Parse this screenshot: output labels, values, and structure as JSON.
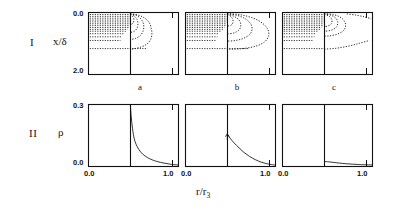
{
  "figure": {
    "width": 403,
    "height": 209,
    "background": "#ffffff",
    "ink": "#111111"
  },
  "rows": [
    {
      "id": "row-I",
      "numeral": "I",
      "ylabel": "x/δ",
      "ytop": "0.0",
      "ybottom": "2.0"
    },
    {
      "id": "row-II",
      "numeral": "II",
      "ylabel": "ρ",
      "ytop": "0.3",
      "ybottom": "0.0"
    }
  ],
  "columns": [
    {
      "letter": "a"
    },
    {
      "letter": "b"
    },
    {
      "letter": "c"
    }
  ],
  "xaxis": {
    "title_main": "r/r",
    "title_sub": "3",
    "left_tick": "0.0",
    "right_tick": "1.0"
  },
  "chart_data": [
    {
      "id": "I-a",
      "type": "line",
      "title": "a",
      "xlabel": "r/r3",
      "ylabel": "x/δ",
      "xlim": [
        0.0,
        1.0
      ],
      "ylim": [
        2.0,
        0.0
      ],
      "y_inverted": true,
      "grid": false,
      "legend": "none",
      "vertical_marker_x": 0.47,
      "series": [
        {
          "name": "recirculation-contour",
          "style": "dotted",
          "points": [
            [
              0.47,
              0.06
            ],
            [
              0.56,
              0.1
            ],
            [
              0.63,
              0.2
            ],
            [
              0.68,
              0.34
            ],
            [
              0.7,
              0.5
            ],
            [
              0.71,
              0.68
            ],
            [
              0.7,
              0.86
            ],
            [
              0.66,
              1.02
            ],
            [
              0.59,
              1.13
            ],
            [
              0.5,
              1.19
            ],
            [
              0.47,
              1.2
            ]
          ]
        },
        {
          "name": "inner-contour-1",
          "style": "dotted",
          "points": [
            [
              0.47,
              0.06
            ],
            [
              0.53,
              0.1
            ],
            [
              0.58,
              0.2
            ],
            [
              0.61,
              0.33
            ],
            [
              0.62,
              0.48
            ],
            [
              0.61,
              0.63
            ],
            [
              0.58,
              0.76
            ],
            [
              0.53,
              0.85
            ],
            [
              0.47,
              0.89
            ]
          ]
        },
        {
          "name": "inner-contour-2",
          "style": "dotted",
          "points": [
            [
              0.47,
              0.06
            ],
            [
              0.51,
              0.12
            ],
            [
              0.545,
              0.24
            ],
            [
              0.555,
              0.38
            ],
            [
              0.545,
              0.52
            ],
            [
              0.515,
              0.62
            ],
            [
              0.47,
              0.66
            ]
          ]
        },
        {
          "name": "inner-contour-3",
          "style": "dotted",
          "points": [
            [
              0.47,
              0.07
            ],
            [
              0.495,
              0.14
            ],
            [
              0.51,
              0.25
            ],
            [
              0.5,
              0.36
            ],
            [
              0.47,
              0.41
            ]
          ]
        },
        {
          "name": "streak-rows",
          "style": "dotted-horizontal",
          "rows_y": [
            0.08,
            0.14,
            0.2,
            0.26,
            0.32,
            0.38,
            0.44,
            0.5,
            0.56,
            0.62,
            0.7,
            0.8,
            0.92,
            1.18
          ],
          "x_start": 0.02,
          "x_end_by_row": [
            0.47,
            0.47,
            0.47,
            0.47,
            0.47,
            0.47,
            0.46,
            0.45,
            0.44,
            0.42,
            0.4,
            0.38,
            0.36,
            0.66
          ]
        }
      ]
    },
    {
      "id": "I-b",
      "type": "line",
      "title": "b",
      "xlabel": "r/r3",
      "ylabel": "x/δ",
      "xlim": [
        0.0,
        1.0
      ],
      "ylim": [
        2.0,
        0.0
      ],
      "y_inverted": true,
      "grid": false,
      "legend": "none",
      "vertical_marker_x": 0.47,
      "series": [
        {
          "name": "recirculation-contour",
          "style": "dotted",
          "points": [
            [
              0.47,
              0.05
            ],
            [
              0.62,
              0.09
            ],
            [
              0.76,
              0.2
            ],
            [
              0.86,
              0.36
            ],
            [
              0.92,
              0.56
            ],
            [
              0.93,
              0.76
            ],
            [
              0.89,
              0.95
            ],
            [
              0.8,
              1.09
            ],
            [
              0.67,
              1.17
            ],
            [
              0.53,
              1.2
            ],
            [
              0.47,
              1.2
            ]
          ]
        },
        {
          "name": "inner-contour-1",
          "style": "dotted",
          "points": [
            [
              0.47,
              0.06
            ],
            [
              0.58,
              0.11
            ],
            [
              0.67,
              0.22
            ],
            [
              0.73,
              0.38
            ],
            [
              0.745,
              0.55
            ],
            [
              0.72,
              0.72
            ],
            [
              0.65,
              0.85
            ],
            [
              0.56,
              0.92
            ],
            [
              0.47,
              0.94
            ]
          ]
        },
        {
          "name": "inner-contour-2",
          "style": "dotted",
          "points": [
            [
              0.47,
              0.07
            ],
            [
              0.545,
              0.14
            ],
            [
              0.6,
              0.26
            ],
            [
              0.62,
              0.41
            ],
            [
              0.605,
              0.56
            ],
            [
              0.55,
              0.67
            ],
            [
              0.47,
              0.71
            ]
          ]
        },
        {
          "name": "inner-contour-3",
          "style": "dotted",
          "points": [
            [
              0.47,
              0.08
            ],
            [
              0.515,
              0.16
            ],
            [
              0.535,
              0.29
            ],
            [
              0.52,
              0.41
            ],
            [
              0.47,
              0.46
            ]
          ]
        },
        {
          "name": "streak-rows",
          "style": "dotted-horizontal",
          "rows_y": [
            0.08,
            0.14,
            0.2,
            0.26,
            0.32,
            0.38,
            0.44,
            0.5,
            0.56,
            0.62,
            0.7,
            0.8,
            0.92,
            1.18
          ],
          "x_start": 0.02,
          "x_end_by_row": [
            0.47,
            0.47,
            0.47,
            0.47,
            0.47,
            0.46,
            0.45,
            0.44,
            0.42,
            0.4,
            0.38,
            0.36,
            0.34,
            0.7
          ]
        }
      ]
    },
    {
      "id": "I-c",
      "type": "line",
      "title": "c",
      "xlabel": "r/r3",
      "ylabel": "x/δ",
      "xlim": [
        0.0,
        1.0
      ],
      "ylim": [
        2.0,
        0.0
      ],
      "y_inverted": true,
      "grid": false,
      "legend": "none",
      "vertical_marker_x": 0.47,
      "series": [
        {
          "name": "recirculation-contour",
          "style": "dotted",
          "points": [
            [
              0.47,
              0.05
            ],
            [
              0.58,
              0.09
            ],
            [
              0.66,
              0.19
            ],
            [
              0.7,
              0.33
            ],
            [
              0.705,
              0.48
            ],
            [
              0.675,
              0.62
            ],
            [
              0.61,
              0.72
            ],
            [
              0.53,
              0.77
            ],
            [
              0.47,
              0.78
            ]
          ]
        },
        {
          "name": "inner-contour-1",
          "style": "dotted",
          "points": [
            [
              0.47,
              0.06
            ],
            [
              0.55,
              0.11
            ],
            [
              0.605,
              0.22
            ],
            [
              0.62,
              0.36
            ],
            [
              0.6,
              0.5
            ],
            [
              0.545,
              0.59
            ],
            [
              0.47,
              0.62
            ]
          ]
        },
        {
          "name": "inner-contour-2",
          "style": "dotted",
          "points": [
            [
              0.47,
              0.07
            ],
            [
              0.525,
              0.14
            ],
            [
              0.555,
              0.26
            ],
            [
              0.545,
              0.39
            ],
            [
              0.5,
              0.46
            ],
            [
              0.47,
              0.47
            ]
          ]
        },
        {
          "name": "upper-right-wisp",
          "style": "dotted",
          "points": [
            [
              0.72,
              0.06
            ],
            [
              0.82,
              0.1
            ],
            [
              0.92,
              0.16
            ],
            [
              0.99,
              0.22
            ]
          ]
        },
        {
          "name": "lower-right-wisp",
          "style": "dotted",
          "points": [
            [
              0.47,
              1.2
            ],
            [
              0.6,
              1.17
            ],
            [
              0.74,
              1.1
            ],
            [
              0.86,
              1.01
            ],
            [
              0.97,
              0.92
            ]
          ]
        },
        {
          "name": "streak-rows",
          "style": "dotted-horizontal",
          "rows_y": [
            0.08,
            0.14,
            0.2,
            0.26,
            0.32,
            0.38,
            0.44,
            0.5,
            0.56,
            0.62,
            0.7,
            0.8,
            0.92,
            1.18
          ],
          "x_start": 0.02,
          "x_end_by_row": [
            0.47,
            0.47,
            0.47,
            0.47,
            0.47,
            0.46,
            0.45,
            0.44,
            0.42,
            0.4,
            0.38,
            0.36,
            0.34,
            0.47
          ]
        }
      ]
    },
    {
      "id": "II-a",
      "type": "line",
      "title": "a",
      "xlabel": "r/r3",
      "ylabel": "ρ",
      "xlim": [
        0.0,
        1.0
      ],
      "ylim": [
        0.0,
        0.3
      ],
      "grid": false,
      "legend": "none",
      "vertical_marker_x": 0.47,
      "series": [
        {
          "name": "density-profile",
          "style": "solid-thin",
          "points": [
            [
              0.47,
              0.3
            ],
            [
              0.48,
              0.24
            ],
            [
              0.495,
              0.18
            ],
            [
              0.515,
              0.13
            ],
            [
              0.545,
              0.095
            ],
            [
              0.585,
              0.068
            ],
            [
              0.635,
              0.048
            ],
            [
              0.695,
              0.033
            ],
            [
              0.765,
              0.022
            ],
            [
              0.845,
              0.014
            ],
            [
              0.925,
              0.008
            ],
            [
              1.0,
              0.005
            ]
          ]
        }
      ]
    },
    {
      "id": "II-b",
      "type": "line",
      "title": "b",
      "xlabel": "r/r3",
      "ylabel": "ρ",
      "xlim": [
        0.0,
        1.0
      ],
      "ylim": [
        0.0,
        0.3
      ],
      "grid": false,
      "legend": "none",
      "vertical_marker_x": 0.47,
      "series": [
        {
          "name": "density-profile",
          "style": "solid-thin",
          "points": [
            [
              0.47,
              0.155
            ],
            [
              0.5,
              0.135
            ],
            [
              0.545,
              0.112
            ],
            [
              0.6,
              0.088
            ],
            [
              0.655,
              0.066
            ],
            [
              0.715,
              0.047
            ],
            [
              0.78,
              0.031
            ],
            [
              0.845,
              0.019
            ],
            [
              0.91,
              0.011
            ],
            [
              0.96,
              0.007
            ],
            [
              1.0,
              0.005
            ]
          ]
        },
        {
          "name": "peak-marker",
          "style": "arrow",
          "points": [
            [
              0.47,
              0.155
            ]
          ]
        }
      ]
    },
    {
      "id": "II-c",
      "type": "line",
      "title": "c",
      "xlabel": "r/r3",
      "ylabel": "ρ",
      "xlim": [
        0.0,
        1.0
      ],
      "ylim": [
        0.0,
        0.3
      ],
      "grid": false,
      "legend": "none",
      "vertical_marker_x": 0.47,
      "series": [
        {
          "name": "density-profile",
          "style": "solid-thin",
          "points": [
            [
              0.47,
              0.022
            ],
            [
              0.52,
              0.02
            ],
            [
              0.58,
              0.017
            ],
            [
              0.64,
              0.014
            ],
            [
              0.71,
              0.011
            ],
            [
              0.78,
              0.009
            ],
            [
              0.85,
              0.007
            ],
            [
              0.92,
              0.006
            ],
            [
              1.0,
              0.005
            ]
          ]
        }
      ]
    }
  ]
}
